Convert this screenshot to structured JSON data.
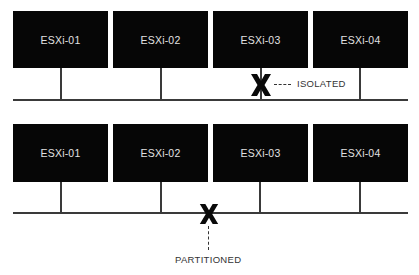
{
  "diagram": {
    "scenarios": [
      {
        "name": "isolated",
        "hosts": [
          {
            "label": "ESXi-01"
          },
          {
            "label": "ESXi-02"
          },
          {
            "label": "ESXi-03"
          },
          {
            "label": "ESXi-04"
          }
        ],
        "failure": {
          "icon": "x-mark-icon",
          "location": "uplink of ESXi-03",
          "label": "ISOLATED"
        }
      },
      {
        "name": "partitioned",
        "hosts": [
          {
            "label": "ESXi-01"
          },
          {
            "label": "ESXi-02"
          },
          {
            "label": "ESXi-03"
          },
          {
            "label": "ESXi-04"
          }
        ],
        "failure": {
          "icon": "x-mark-icon",
          "location": "network bus between ESXi-02 and ESXi-03",
          "label": "PARTITIONED"
        }
      }
    ],
    "colors": {
      "host_fill": "#060606",
      "host_text": "#e2e2e2",
      "line": "#3a3a3a",
      "label_text": "#333333",
      "background": "#ffffff"
    }
  }
}
